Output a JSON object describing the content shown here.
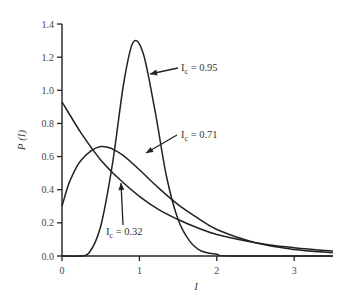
{
  "chart_data": {
    "type": "line",
    "title": "",
    "xlabel": "I",
    "ylabel": "P (I)",
    "xlim": [
      0,
      3.5
    ],
    "ylim": [
      0,
      1.4
    ],
    "xticks": [
      "0",
      "1",
      "2",
      "3"
    ],
    "yticks": [
      "0.0",
      "0.2",
      "0.4",
      "0.6",
      "0.8",
      "1.0",
      "1.2",
      "1.4"
    ],
    "grid": false,
    "legend": "none (inline annotations with arrows)",
    "series": [
      {
        "name": "Ic = 0.32",
        "x": [
          0,
          0.25,
          0.5,
          0.75,
          1.0,
          1.25,
          1.5,
          1.75,
          2.0,
          2.5,
          3.0,
          3.5
        ],
        "values": [
          0.93,
          0.74,
          0.58,
          0.46,
          0.36,
          0.28,
          0.22,
          0.17,
          0.13,
          0.08,
          0.05,
          0.03
        ]
      },
      {
        "name": "Ic = 0.71",
        "x": [
          0,
          0.1,
          0.25,
          0.5,
          0.75,
          1.0,
          1.25,
          1.5,
          1.75,
          2.0,
          2.5,
          3.0,
          3.5
        ],
        "values": [
          0.3,
          0.45,
          0.58,
          0.66,
          0.62,
          0.52,
          0.41,
          0.31,
          0.23,
          0.16,
          0.08,
          0.04,
          0.02
        ]
      },
      {
        "name": "Ic = 0.95",
        "x": [
          0,
          0.2,
          0.35,
          0.5,
          0.65,
          0.8,
          0.92,
          1.05,
          1.2,
          1.35,
          1.5,
          1.65,
          1.8,
          2.0,
          2.2,
          3.5
        ],
        "values": [
          0.0,
          0.0,
          0.02,
          0.18,
          0.55,
          1.05,
          1.29,
          1.22,
          0.88,
          0.48,
          0.22,
          0.09,
          0.03,
          0.01,
          0.0,
          0.0
        ]
      }
    ],
    "annotations": [
      {
        "text": "Ic = 0.95",
        "subscript": "c",
        "base": "I",
        "value": "= 0.95"
      },
      {
        "text": "Ic = 0.71",
        "subscript": "c",
        "base": "I",
        "value": "= 0.71"
      },
      {
        "text": "Ic = 0.32",
        "subscript": "c",
        "base": "I",
        "value": "= 0.32"
      }
    ]
  }
}
